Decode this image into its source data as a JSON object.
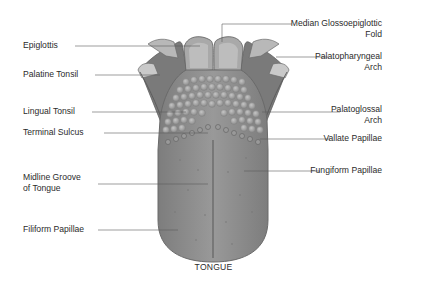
{
  "diagram": {
    "title": "TONGUE",
    "colors": {
      "tongue_body": "#8f8f8f",
      "tongue_edge": "#6e6e6e",
      "papillae": "#a6a6a6",
      "side_flaps": "#7a7a7a",
      "leader_line": "#5a5a5a"
    },
    "labels_left": [
      {
        "id": "epiglottis",
        "text": "Epiglottis"
      },
      {
        "id": "palatine-tonsil",
        "text": "Palatine Tonsil"
      },
      {
        "id": "lingual-tonsil",
        "text": "Lingual Tonsil"
      },
      {
        "id": "terminal-sulcus",
        "text": "Terminal Sulcus"
      },
      {
        "id": "midline-groove",
        "line1": "Midline Groove",
        "line2": "of Tongue"
      },
      {
        "id": "filiform-papillae",
        "text": "Filiform Papillae"
      }
    ],
    "labels_right": [
      {
        "id": "median-glossoepiglottic-fold",
        "line1": "Median Glossoepiglottic",
        "line2": "Fold"
      },
      {
        "id": "palatopharyngeal-arch",
        "line1": "Palatopharyngeal",
        "line2": "Arch"
      },
      {
        "id": "palatoglossal-arch",
        "line1": "Palatoglossal",
        "line2": "Arch"
      },
      {
        "id": "vallate-papillae",
        "text": "Vallate Papillae"
      },
      {
        "id": "fungiform-papillae",
        "text": "Fungiform Papillae"
      }
    ]
  }
}
